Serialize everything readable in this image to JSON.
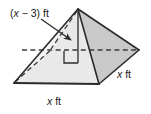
{
  "figure": {
    "type": "square-pyramid-diagram",
    "colors": {
      "outline": "#2b2b2b",
      "front_left_face": "#f2f2f2",
      "front_right_face": "#e4e4e4",
      "right_face": "#c9c9c9",
      "hidden_edge": "#4a4a4a",
      "leader_line": "#2b2b2b",
      "text": "#1a1a1a",
      "background": "#ffffff"
    },
    "labels": {
      "height": {
        "prefix": "(",
        "variable": "x",
        "operator": " − ",
        "number": "3",
        "suffix": ") ft",
        "full": "(x − 3) ft",
        "role": "height-of-pyramid"
      },
      "base_front": {
        "variable": "x",
        "unit": "ft",
        "full": "x ft",
        "role": "front-base-edge"
      },
      "base_right": {
        "variable": "x",
        "unit": "ft",
        "full": "x ft",
        "role": "right-base-edge"
      }
    },
    "markers": {
      "right_angle": "right-angle-square",
      "leader_arrow": "arrow-pointing-to-height-segment"
    },
    "geometry": {
      "apex": [
        78,
        9
      ],
      "left_vertex": [
        14,
        83
      ],
      "front_vertex": [
        99,
        84
      ],
      "right_vertex": [
        139,
        50
      ],
      "back_vertex": [
        50,
        50
      ],
      "height_foot": [
        78,
        62
      ]
    }
  }
}
